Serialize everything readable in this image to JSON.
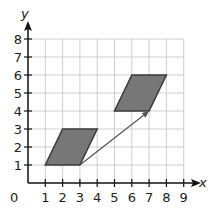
{
  "diagram": {
    "type": "coordinate-plane-translation",
    "x_axis": {
      "label": "x",
      "ticks": [
        "1",
        "2",
        "3",
        "4",
        "5",
        "6",
        "7",
        "8",
        "9"
      ],
      "range": [
        0,
        9
      ]
    },
    "y_axis": {
      "label": "y",
      "ticks": [
        "1",
        "2",
        "3",
        "4",
        "5",
        "6",
        "7",
        "8"
      ],
      "range": [
        0,
        8
      ]
    },
    "origin_label": "0",
    "shapes": [
      {
        "name": "parallelogram-original",
        "vertices": [
          [
            1,
            1
          ],
          [
            3,
            1
          ],
          [
            4,
            3
          ],
          [
            2,
            3
          ]
        ]
      },
      {
        "name": "parallelogram-translated",
        "vertices": [
          [
            5,
            4
          ],
          [
            7,
            4
          ],
          [
            8,
            6
          ],
          [
            6,
            6
          ]
        ]
      }
    ],
    "translation_arrow": {
      "from": [
        3,
        1
      ],
      "to": [
        7,
        4
      ]
    },
    "colors": {
      "grid": "#cfcfcf",
      "axis": "#111111",
      "shape_fill": "#777777",
      "shape_stroke": "#3a3a3a",
      "arrow": "#555555"
    }
  }
}
